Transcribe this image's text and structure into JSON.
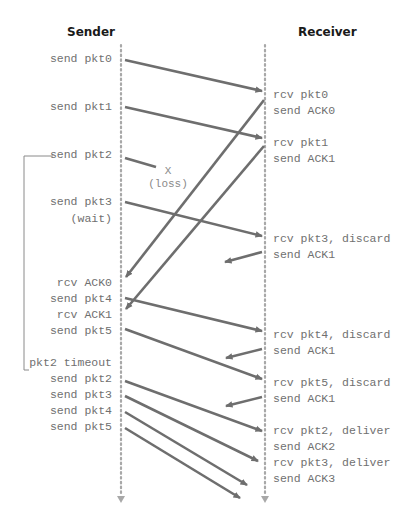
{
  "diagram": {
    "type": "sequence-diagram",
    "participants": {
      "sender": "Sender",
      "receiver": "Receiver"
    },
    "sender_labels": [
      "send pkt0",
      "send pkt1",
      "send pkt2",
      "send pkt3",
      "(wait)",
      "rcv ACK0",
      "send pkt4",
      "rcv ACK1",
      "send pkt5",
      "pkt2 timeout",
      "send pkt2",
      "send pkt3",
      "send pkt4",
      "send pkt5"
    ],
    "receiver_labels": [
      "rcv pkt0",
      "send ACK0",
      "rcv pkt1",
      "send ACK1",
      "rcv pkt3, discard",
      "send ACK1",
      "rcv pkt4, discard",
      "send ACK1",
      "rcv pkt5, discard",
      "send ACK1",
      "rcv pkt2, deliver",
      "send ACK2",
      "rcv pkt3, deliver",
      "send ACK3"
    ],
    "loss_marker": {
      "symbol": "X",
      "label": "(loss)"
    },
    "messages": [
      {
        "from": "sender",
        "to": "receiver",
        "label": "pkt0",
        "status": "delivered"
      },
      {
        "from": "sender",
        "to": "receiver",
        "label": "pkt1",
        "status": "delivered"
      },
      {
        "from": "sender",
        "to": "receiver",
        "label": "pkt2",
        "status": "lost"
      },
      {
        "from": "receiver",
        "to": "sender",
        "label": "ACK0",
        "status": "delivered"
      },
      {
        "from": "receiver",
        "to": "sender",
        "label": "ACK1",
        "status": "delivered"
      },
      {
        "from": "sender",
        "to": "receiver",
        "label": "pkt3",
        "status": "discarded"
      },
      {
        "from": "receiver",
        "to": "sender",
        "label": "ACK1",
        "status": "partial"
      },
      {
        "from": "sender",
        "to": "receiver",
        "label": "pkt4",
        "status": "discarded"
      },
      {
        "from": "receiver",
        "to": "sender",
        "label": "ACK1",
        "status": "partial"
      },
      {
        "from": "sender",
        "to": "receiver",
        "label": "pkt5",
        "status": "discarded"
      },
      {
        "from": "receiver",
        "to": "sender",
        "label": "ACK1",
        "status": "partial"
      },
      {
        "from": "sender",
        "to": "receiver",
        "label": "pkt2",
        "status": "delivered"
      },
      {
        "from": "sender",
        "to": "receiver",
        "label": "pkt3",
        "status": "delivered"
      },
      {
        "from": "sender",
        "to": "receiver",
        "label": "pkt4",
        "status": "in-flight"
      },
      {
        "from": "sender",
        "to": "receiver",
        "label": "pkt5",
        "status": "in-flight"
      }
    ],
    "colors": {
      "arrow": "#6e6e6e",
      "timeline": "#a8a8a8",
      "label_text": "#707070",
      "header_text": "#1a1a1a"
    }
  }
}
